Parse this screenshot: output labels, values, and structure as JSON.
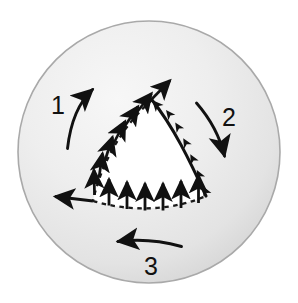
{
  "figure": {
    "type": "diagram",
    "width": 298,
    "height": 303,
    "background_color": "#ffffff"
  },
  "sphere": {
    "name": "shaded-circle",
    "center_x": 149,
    "center_y": 152,
    "radius": 132,
    "fill_light": "#f2f2f2",
    "fill_mid": "#e2e2e2",
    "fill_dark": "#cfcfcf",
    "stroke_color": "#a8a8a8"
  },
  "triangle": {
    "name": "spherical-triangle",
    "fill": "#ffffff",
    "apex_x": 152,
    "apex_y": 100,
    "left_vertex_x": 93,
    "left_vertex_y": 201,
    "right_vertex_x": 206,
    "right_vertex_y": 196,
    "dashed_stroke": "#111111",
    "solid_stroke": "#111111"
  },
  "edges": [
    {
      "name": "edge-left-dashed",
      "style": "dashed",
      "arrow_count": 7,
      "arrow_direction": "outward-upper-left"
    },
    {
      "name": "edge-bottom-dashed",
      "style": "dashed",
      "arrow_count": 6,
      "arrow_direction": "upward-into-triangle"
    },
    {
      "name": "edge-right-solid",
      "style": "solid",
      "arrow_count": 7,
      "arrow_direction": "along-curve-toward-apex"
    }
  ],
  "labels": [
    {
      "id": "1",
      "text": "1",
      "x": 58,
      "y": 114
    },
    {
      "id": "2",
      "text": "2",
      "x": 221,
      "y": 126
    },
    {
      "id": "3",
      "text": "3",
      "x": 144,
      "y": 275
    }
  ],
  "curved_arrows": [
    {
      "name": "curved-arrow-1",
      "label": "1",
      "description": "curves upward to the right on the left side of the sphere",
      "color": "#111111"
    },
    {
      "name": "curved-arrow-2",
      "label": "2",
      "description": "curves downward to the right on the right side of the sphere",
      "color": "#111111"
    },
    {
      "name": "curved-arrow-3",
      "label": "3",
      "description": "points to the left near the bottom of the sphere",
      "color": "#111111"
    }
  ],
  "colors": {
    "ink": "#111111",
    "paper": "#ffffff",
    "sphere_light": "#f2f2f2",
    "sphere_shadow": "#cfcfcf"
  }
}
